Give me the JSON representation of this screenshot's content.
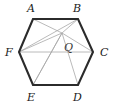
{
  "figure": {
    "type": "geometry-diagram",
    "shape": "regular-hexagon",
    "colors": {
      "outline": "#2b2b2b",
      "interior_lines": "#a8a8a8",
      "label_text": "#1a1a1a",
      "background": "#ffffff"
    },
    "stroke_widths": {
      "outline": 2.1,
      "interior": 0.8
    },
    "vertices": [
      {
        "id": "A",
        "label": "A",
        "x": 33,
        "y": 19,
        "label_x": 27,
        "label_y": 3
      },
      {
        "id": "B",
        "label": "B",
        "x": 78,
        "y": 19,
        "label_x": 73,
        "label_y": 3
      },
      {
        "id": "C",
        "label": "C",
        "x": 93,
        "y": 52,
        "label_x": 100,
        "label_y": 47
      },
      {
        "id": "D",
        "label": "D",
        "x": 78,
        "y": 85,
        "label_x": 73,
        "label_y": 92
      },
      {
        "id": "E",
        "label": "E",
        "x": 33,
        "y": 85,
        "label_x": 27,
        "label_y": 92
      },
      {
        "id": "F",
        "label": "F",
        "x": 19,
        "y": 52,
        "label_x": 5,
        "label_y": 47
      }
    ],
    "interior_point": {
      "id": "Q",
      "label": "Q",
      "x": 62,
      "y": 33,
      "label_x": 64,
      "label_y": 42
    },
    "interior_segments": [
      {
        "from": "A",
        "to": "Q"
      },
      {
        "from": "B",
        "to": "Q"
      },
      {
        "from": "C",
        "to": "Q"
      },
      {
        "from": "D",
        "to": "Q"
      },
      {
        "from": "E",
        "to": "Q"
      },
      {
        "from": "F",
        "to": "Q"
      },
      {
        "from": "F",
        "to": "B"
      },
      {
        "from": "F",
        "to": "C"
      },
      {
        "from": "E",
        "to": "Q"
      }
    ],
    "outline_path": "M 33 19 L 78 19 L 93 52 L 78 85 L 33 85 L 19 52 Z"
  }
}
